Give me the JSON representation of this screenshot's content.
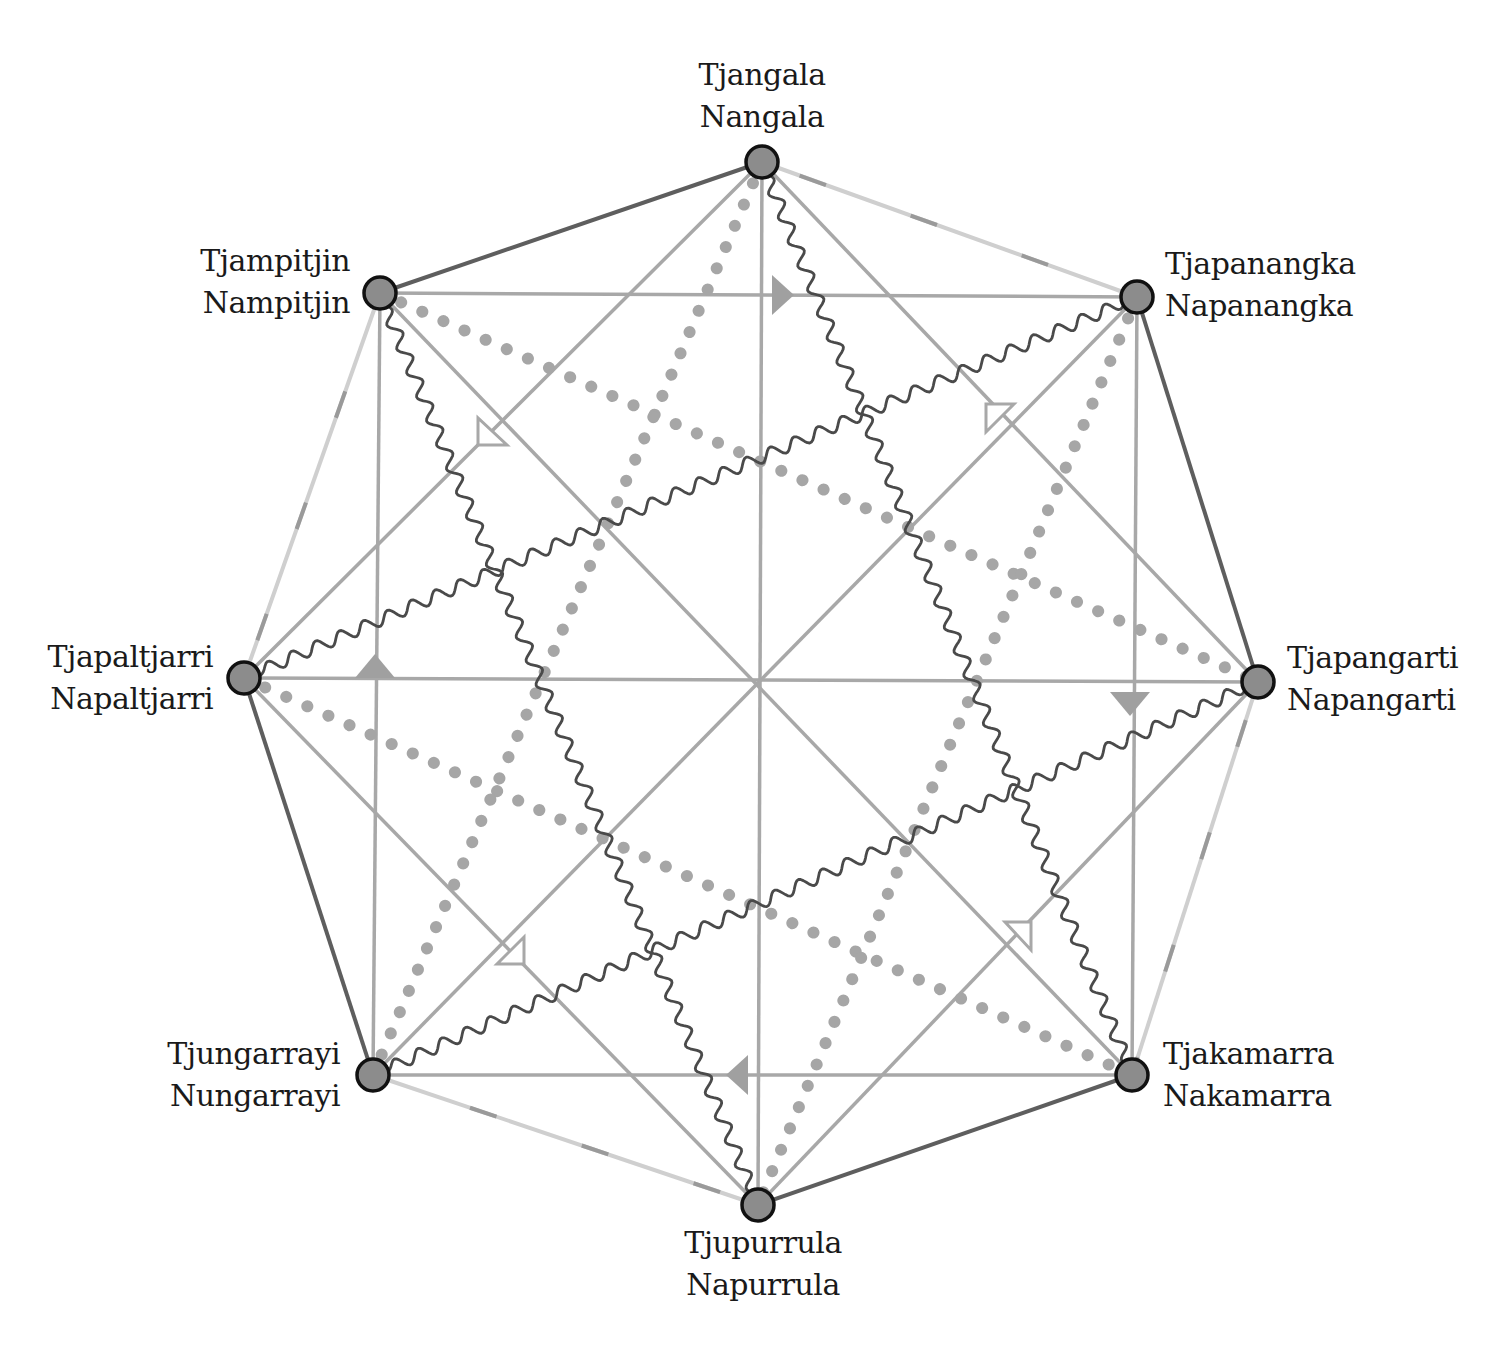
{
  "diagram": {
    "type": "kinship-subsection-octagon",
    "center": {
      "x": 760,
      "y": 685
    },
    "colors": {
      "node_fill": "#8c8c8c",
      "node_stroke": "#111111",
      "outer_dark": "#5e5e5e",
      "outer_light": "#cfcfcf",
      "outer_dash": "#9a9a9a",
      "straight_gray": "#a8a8a8",
      "dotted_gray": "#a6a6a6",
      "wavy_dark": "#4a4a4a",
      "arrow_filled": "#a0a0a0",
      "arrow_hollow": "#a8a8a8",
      "text": "#1a1a1a"
    },
    "nodes": [
      {
        "id": "n0",
        "male": "Tjangala",
        "female": "Nangala",
        "x": 762,
        "y": 162
      },
      {
        "id": "n1",
        "male": "Tjapanangka",
        "female": "Napanangka",
        "x": 1137,
        "y": 297
      },
      {
        "id": "n2",
        "male": "Tjapangarti",
        "female": "Napangarti",
        "x": 1258,
        "y": 682
      },
      {
        "id": "n3",
        "male": "Tjakamarra",
        "female": "Nakamarra",
        "x": 1132,
        "y": 1075
      },
      {
        "id": "n4",
        "male": "Tjupurrula",
        "female": "Napurrula",
        "x": 758,
        "y": 1205
      },
      {
        "id": "n5",
        "male": "Tjungarrayi",
        "female": "Nungarrayi",
        "x": 373,
        "y": 1075
      },
      {
        "id": "n6",
        "male": "Tjapaltjarri",
        "female": "Napaltjarri",
        "x": 244,
        "y": 678
      },
      {
        "id": "n7",
        "male": "Tjampitjin",
        "female": "Nampitjin",
        "x": 380,
        "y": 293
      }
    ],
    "labels": [
      {
        "node": "n0",
        "male": "Tjangala",
        "female": "Nangala",
        "x": 762,
        "y": 54,
        "align": "center"
      },
      {
        "node": "n1",
        "male": "Tjapanangka",
        "female": "Napanangka",
        "x": 1165,
        "y": 243,
        "align": "left"
      },
      {
        "node": "n2",
        "male": "Tjapangarti",
        "female": "Napangarti",
        "x": 1287,
        "y": 637,
        "align": "left"
      },
      {
        "node": "n3",
        "male": "Tjakamarra",
        "female": "Nakamarra",
        "x": 1163,
        "y": 1033,
        "align": "left"
      },
      {
        "node": "n4",
        "male": "Tjupurrula",
        "female": "Napurrula",
        "x": 763,
        "y": 1222,
        "align": "center"
      },
      {
        "node": "n5",
        "male": "Tjungarrayi",
        "female": "Nungarrayi",
        "x": 340,
        "y": 1033,
        "align": "right"
      },
      {
        "node": "n6",
        "male": "Tjapaltjarri",
        "female": "Napaltjarri",
        "x": 213,
        "y": 636,
        "align": "right"
      },
      {
        "node": "n7",
        "male": "Tjampitjin",
        "female": "Nampitjin",
        "x": 350,
        "y": 240,
        "align": "right"
      }
    ],
    "edges": {
      "outer_dark": [
        [
          "n0",
          "n7"
        ],
        [
          "n1",
          "n2"
        ],
        [
          "n3",
          "n4"
        ],
        [
          "n5",
          "n6"
        ]
      ],
      "outer_light_dashed": [
        [
          "n0",
          "n1"
        ],
        [
          "n2",
          "n3"
        ],
        [
          "n4",
          "n5"
        ],
        [
          "n6",
          "n7"
        ]
      ],
      "diameters": [
        [
          "n0",
          "n4"
        ],
        [
          "n1",
          "n5"
        ],
        [
          "n2",
          "n6"
        ],
        [
          "n3",
          "n7"
        ]
      ],
      "square_diagonal": [
        [
          "n0",
          "n2"
        ],
        [
          "n2",
          "n4"
        ],
        [
          "n4",
          "n6"
        ],
        [
          "n6",
          "n0"
        ]
      ],
      "square_axis": [
        [
          "n7",
          "n1"
        ],
        [
          "n1",
          "n3"
        ],
        [
          "n3",
          "n5"
        ],
        [
          "n5",
          "n7"
        ]
      ],
      "wavy": [
        [
          "n0",
          "n3"
        ],
        [
          "n1",
          "n6"
        ],
        [
          "n2",
          "n5"
        ],
        [
          "n7",
          "n4"
        ]
      ],
      "dotted": [
        [
          "n7",
          "n2"
        ],
        [
          "n6",
          "n3"
        ],
        [
          "n0",
          "n5"
        ],
        [
          "n1",
          "n4"
        ]
      ]
    },
    "arrows_filled": [
      {
        "x": 780,
        "y": 295,
        "direction": "right"
      },
      {
        "x": 1130,
        "y": 702,
        "direction": "down"
      },
      {
        "x": 740,
        "y": 1075,
        "direction": "left"
      },
      {
        "x": 375,
        "y": 668,
        "direction": "up"
      }
    ],
    "arrows_hollow": [
      {
        "x": 492,
        "y": 433,
        "direction": "down-right"
      },
      {
        "x": 1000,
        "y": 417,
        "direction": "down-left"
      },
      {
        "x": 512,
        "y": 952,
        "direction": "up-right"
      },
      {
        "x": 1018,
        "y": 935,
        "direction": "up-left"
      }
    ]
  }
}
